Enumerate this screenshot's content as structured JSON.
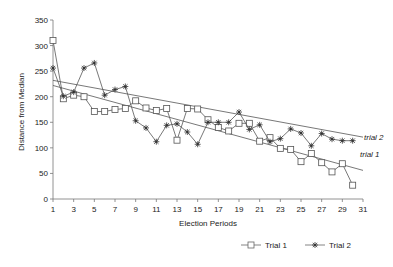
{
  "chart_data": {
    "type": "line",
    "title": "",
    "xlabel": "Election Periods",
    "ylabel": "Distance from Median",
    "xlim": [
      1,
      31
    ],
    "ylim": [
      0,
      350
    ],
    "x_ticks": [
      1,
      3,
      5,
      7,
      9,
      11,
      13,
      15,
      17,
      19,
      21,
      23,
      25,
      27,
      29,
      31
    ],
    "y_ticks": [
      0,
      50,
      100,
      150,
      200,
      250,
      300,
      350
    ],
    "grid": false,
    "legend_position": "bottom-right",
    "x": [
      1,
      2,
      3,
      4,
      5,
      6,
      7,
      8,
      9,
      10,
      11,
      12,
      13,
      14,
      15,
      16,
      17,
      18,
      19,
      20,
      21,
      22,
      23,
      24,
      25,
      26,
      27,
      28,
      29,
      30
    ],
    "series": [
      {
        "name": "Trial 1",
        "marker": "square",
        "values": [
          310,
          196,
          203,
          200,
          171,
          171,
          175,
          177,
          192,
          178,
          173,
          177,
          115,
          177,
          176,
          155,
          140,
          133,
          148,
          148,
          113,
          120,
          99,
          97,
          73,
          89,
          71,
          53,
          69,
          27
        ]
      },
      {
        "name": "Trial 2",
        "marker": "star",
        "values": [
          256,
          201,
          209,
          256,
          266,
          203,
          214,
          220,
          153,
          139,
          112,
          144,
          147,
          131,
          107,
          150,
          150,
          150,
          170,
          136,
          145,
          112,
          118,
          137,
          129,
          104,
          128,
          117,
          114,
          114
        ]
      }
    ],
    "trendlines": [
      {
        "name": "trial 1",
        "label": "trial 1",
        "start": [
          1,
          222
        ],
        "end": [
          31,
          56
        ]
      },
      {
        "name": "trial 2",
        "label": "trial 2",
        "start": [
          1,
          232
        ],
        "end": [
          31,
          121
        ]
      }
    ],
    "annotations": [
      "trial 2",
      "trial 1"
    ]
  },
  "legend": {
    "items": [
      {
        "label": "Trial 1",
        "marker": "square"
      },
      {
        "label": "Trial 2",
        "marker": "star"
      }
    ]
  },
  "colors": {
    "line": "#555555",
    "axis": "#777777",
    "text": "#222222"
  }
}
